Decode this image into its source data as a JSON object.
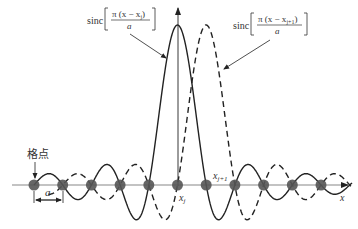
{
  "diagram": {
    "title": "",
    "labels": {
      "lattice_point": "格点",
      "spacing": "a",
      "xj": "x",
      "xj_sub": "j",
      "xj1": "x",
      "xj1_sub": "j+1",
      "axis": "x",
      "formula_left": {
        "prefix": "sinc",
        "numerator": "π (x − x",
        "numerator_sub": "j",
        "numerator_close": ")",
        "denominator": "a"
      },
      "formula_right": {
        "prefix": "sinc",
        "numerator": "π (x − x",
        "numerator_sub": "j+1",
        "numerator_close": ")",
        "denominator": "a"
      }
    },
    "curves": [
      {
        "name": "sinc centered at x_j",
        "style": "solid",
        "center_index": 5
      },
      {
        "name": "sinc centered at x_j+1",
        "style": "dashed",
        "center_index": 6
      }
    ],
    "lattice": {
      "count": 11,
      "x0": 34,
      "spacing": 28.7,
      "axis_y": 185
    },
    "colors": {
      "stroke": "#222222",
      "point": "#555555",
      "axis": "#888888"
    }
  }
}
